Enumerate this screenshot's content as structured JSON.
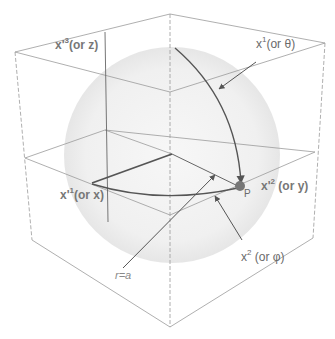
{
  "diagram": {
    "colors": {
      "cube_edges": "#9a9a9a",
      "sphere_fill": "#eeeeee",
      "curves": "#555555",
      "point": "#777777",
      "labels": "#6a6a6a"
    },
    "labels": {
      "z_axis": {
        "base": "x'",
        "sup": "3",
        "suffix": "(or z)"
      },
      "x1_theta": {
        "base": "x",
        "sup": "1",
        "suffix": "(or θ)"
      },
      "x_axis": {
        "base": "x'",
        "sup": "1",
        "suffix": "(or x)"
      },
      "y_axis": {
        "base": "x'",
        "sup": "2",
        "suffix": " (or y)"
      },
      "x2_phi": {
        "base": "x",
        "sup": "2",
        "suffix": " (or φ)"
      },
      "radius": "r=a",
      "point": "P"
    }
  }
}
